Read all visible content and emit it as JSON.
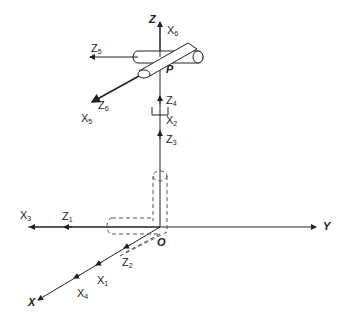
{
  "diagram": {
    "type": "robot-arm coordinate frames",
    "axes": {
      "Z": {
        "label": "Z"
      },
      "Y": {
        "label": "Y"
      },
      "X": {
        "label": "X"
      },
      "origin": {
        "label": "O"
      },
      "point": {
        "label": "P"
      }
    },
    "frame_labels": {
      "x6": {
        "base": "X",
        "sub": "6"
      },
      "z5": {
        "base": "Z",
        "sub": "5"
      },
      "z6": {
        "base": "Z",
        "sub": "6"
      },
      "x5": {
        "base": "X",
        "sub": "5"
      },
      "z4": {
        "base": "Z",
        "sub": "4"
      },
      "x2": {
        "base": "X",
        "sub": "2"
      },
      "z3": {
        "base": "Z",
        "sub": "3"
      },
      "x3": {
        "base": "X",
        "sub": "3"
      },
      "z1": {
        "base": "Z",
        "sub": "1"
      },
      "z2": {
        "base": "Z",
        "sub": "2"
      },
      "x1": {
        "base": "X",
        "sub": "1"
      },
      "x4": {
        "base": "X",
        "sub": "4"
      }
    },
    "colors": {
      "line": "#222222",
      "dashed": "#555555",
      "background": "#ffffff"
    }
  }
}
